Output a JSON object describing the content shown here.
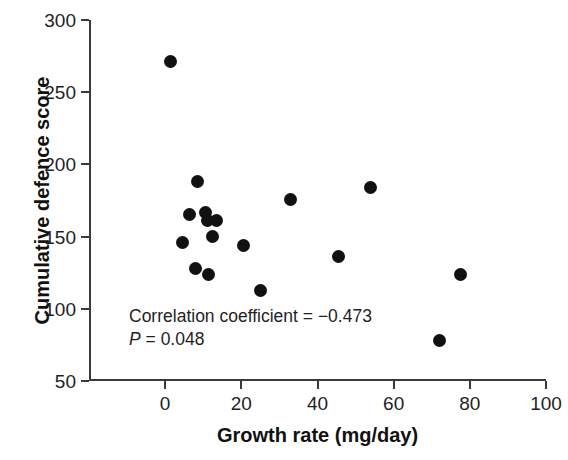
{
  "chart_data": {
    "type": "scatter",
    "title": "",
    "xlabel": "Growth rate (mg/day)",
    "ylabel": "Cumulative defence score",
    "xlim": [
      -20,
      100
    ],
    "ylim": [
      50,
      300
    ],
    "xticks": [
      0,
      20,
      40,
      60,
      80,
      100
    ],
    "yticks": [
      50,
      100,
      150,
      200,
      250,
      300
    ],
    "xticklabels": [
      "0",
      "20",
      "40",
      "60",
      "80",
      "100"
    ],
    "yticklabels": [
      "50",
      "100",
      "150",
      "200",
      "250",
      "300"
    ],
    "grid": false,
    "legend": "none",
    "marker": "filled-circle",
    "marker_color": "#111111",
    "points": [
      {
        "x": 1.5,
        "y": 271
      },
      {
        "x": 8.5,
        "y": 188
      },
      {
        "x": 6.5,
        "y": 165
      },
      {
        "x": 10.5,
        "y": 167
      },
      {
        "x": 11.0,
        "y": 161
      },
      {
        "x": 13.5,
        "y": 161
      },
      {
        "x": 4.5,
        "y": 146
      },
      {
        "x": 12.5,
        "y": 150
      },
      {
        "x": 20.5,
        "y": 144
      },
      {
        "x": 8.0,
        "y": 128
      },
      {
        "x": 11.5,
        "y": 124
      },
      {
        "x": 25.0,
        "y": 113
      },
      {
        "x": 33.0,
        "y": 176
      },
      {
        "x": 54.0,
        "y": 184
      },
      {
        "x": 45.5,
        "y": 136
      },
      {
        "x": 77.5,
        "y": 124
      },
      {
        "x": 72.0,
        "y": 78
      }
    ],
    "annotations": [
      {
        "text": "Correlation coefficient = −0.473"
      },
      {
        "text_prefix": "P",
        "text_rest": " = 0.048"
      }
    ],
    "statistics": {
      "correlation_coefficient": -0.473,
      "p_value": 0.048,
      "n": 17
    }
  }
}
